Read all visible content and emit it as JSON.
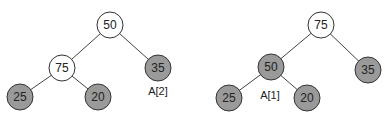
{
  "diagram": {
    "type": "binary-heap-trees",
    "trees": [
      {
        "name": "before",
        "nodes": [
          {
            "id": "root",
            "value": "50",
            "fill": "white"
          },
          {
            "id": "left",
            "value": "75",
            "fill": "white"
          },
          {
            "id": "right",
            "value": "35",
            "fill": "gray"
          },
          {
            "id": "left-left",
            "value": "25",
            "fill": "gray"
          },
          {
            "id": "left-right",
            "value": "20",
            "fill": "gray"
          }
        ],
        "label": "A[2]"
      },
      {
        "name": "after",
        "nodes": [
          {
            "id": "root",
            "value": "75",
            "fill": "white"
          },
          {
            "id": "left",
            "value": "50",
            "fill": "gray"
          },
          {
            "id": "right",
            "value": "35",
            "fill": "gray"
          },
          {
            "id": "left-left",
            "value": "25",
            "fill": "gray"
          },
          {
            "id": "left-right",
            "value": "20",
            "fill": "gray"
          }
        ],
        "label": "A[1]"
      }
    ],
    "colors": {
      "white_node": "#ffffff",
      "gray_node": "#9a9a9a",
      "stroke": "#333333"
    }
  }
}
